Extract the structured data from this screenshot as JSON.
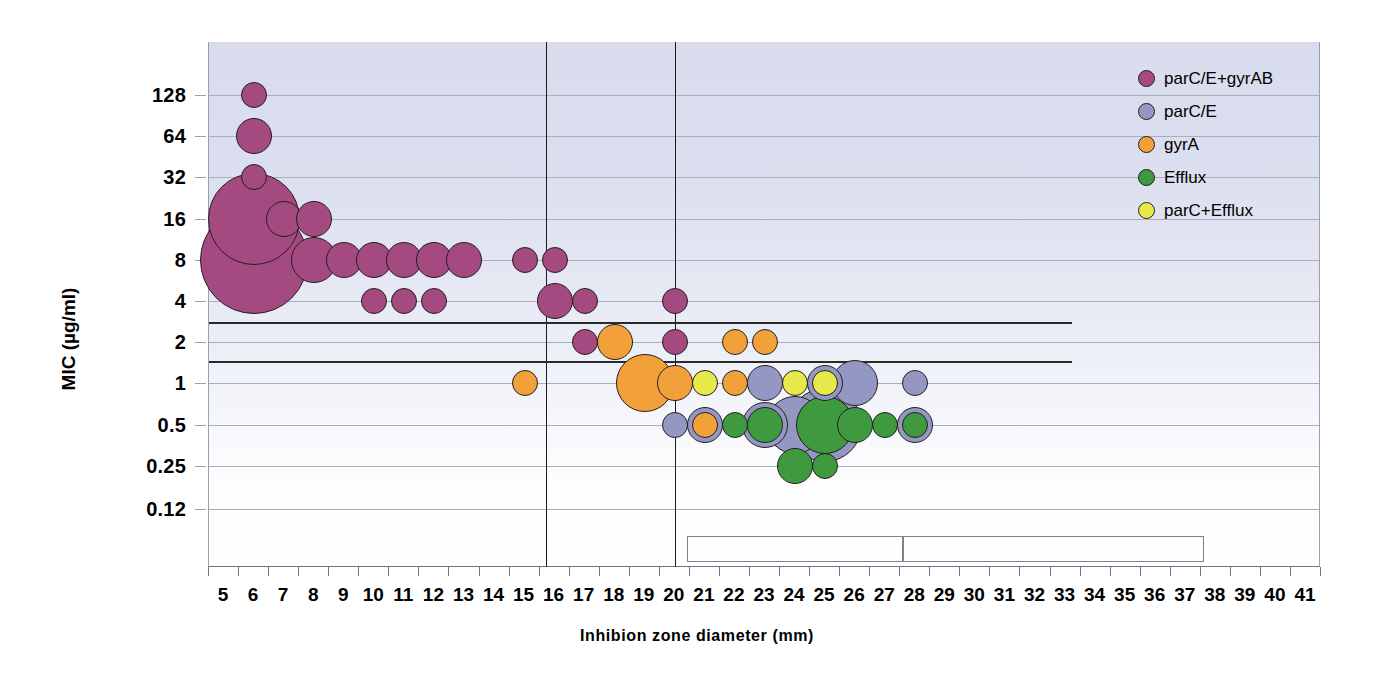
{
  "chart_data": {
    "type": "scatter",
    "title": "",
    "xlabel": "Inhibion zone diameter (mm)",
    "ylabel": "MIC (µg/ml)",
    "xlim": [
      4.5,
      41.5
    ],
    "ylim_labels": [
      "0.12",
      "0.25",
      "0.5",
      "1",
      "2",
      "4",
      "8",
      "16",
      "32",
      "64",
      "128"
    ],
    "x_ticks": [
      5,
      6,
      7,
      8,
      9,
      10,
      11,
      12,
      13,
      14,
      15,
      16,
      17,
      18,
      19,
      20,
      21,
      22,
      23,
      24,
      25,
      26,
      27,
      28,
      29,
      30,
      31,
      32,
      33,
      34,
      35,
      36,
      37,
      38,
      39,
      40,
      41
    ],
    "y_ticks": [
      0.12,
      0.25,
      0.5,
      1,
      2,
      4,
      8,
      16,
      32,
      64,
      128
    ],
    "grid": true,
    "legend_position": "right",
    "y_scale": "log2",
    "reference_lines": {
      "vertical": [
        15.7,
        20.0
      ],
      "horizontal": [
        2.8,
        1.45
      ]
    },
    "series": [
      {
        "name": "parC/E+gyrAB",
        "color": "#a44a80"
      },
      {
        "name": "parC/E",
        "color": "#9397c2"
      },
      {
        "name": "gyrA",
        "color": "#f2a13a"
      },
      {
        "name": "Efflux",
        "color": "#3f9a3f"
      },
      {
        "name": "parC+Efflux",
        "color": "#e7e84a"
      }
    ],
    "points": [
      {
        "x": 6,
        "y": 128,
        "size": 1,
        "series": 0
      },
      {
        "x": 6,
        "y": 64,
        "size": 2,
        "series": 0
      },
      {
        "x": 6,
        "y": 32,
        "size": 1,
        "series": 0
      },
      {
        "x": 6,
        "y": 16,
        "size": 6,
        "series": 0
      },
      {
        "x": 6,
        "y": 8,
        "size": 7,
        "series": 0
      },
      {
        "x": 7,
        "y": 16,
        "size": 2,
        "series": 0
      },
      {
        "x": 8,
        "y": 16,
        "size": 2,
        "series": 0
      },
      {
        "x": 8,
        "y": 8,
        "size": 3,
        "series": 0
      },
      {
        "x": 9,
        "y": 8,
        "size": 2,
        "series": 0
      },
      {
        "x": 10,
        "y": 8,
        "size": 2,
        "series": 0
      },
      {
        "x": 11,
        "y": 8,
        "size": 2,
        "series": 0
      },
      {
        "x": 12,
        "y": 8,
        "size": 2,
        "series": 0
      },
      {
        "x": 13,
        "y": 8,
        "size": 2,
        "series": 0
      },
      {
        "x": 10,
        "y": 4,
        "size": 1,
        "series": 0
      },
      {
        "x": 11,
        "y": 4,
        "size": 1,
        "series": 0
      },
      {
        "x": 12,
        "y": 4,
        "size": 1,
        "series": 0
      },
      {
        "x": 15,
        "y": 8,
        "size": 1,
        "series": 0
      },
      {
        "x": 16,
        "y": 8,
        "size": 1,
        "series": 0
      },
      {
        "x": 16,
        "y": 4,
        "size": 2,
        "series": 0
      },
      {
        "x": 17,
        "y": 4,
        "size": 1,
        "series": 0
      },
      {
        "x": 17,
        "y": 2,
        "size": 1,
        "series": 0
      },
      {
        "x": 18,
        "y": 2,
        "size": 2,
        "series": 2
      },
      {
        "x": 15,
        "y": 1,
        "size": 1,
        "series": 2
      },
      {
        "x": 20,
        "y": 4,
        "size": 1,
        "series": 0
      },
      {
        "x": 20,
        "y": 2,
        "size": 1,
        "series": 0
      },
      {
        "x": 22,
        "y": 2,
        "size": 1,
        "series": 2
      },
      {
        "x": 23,
        "y": 2,
        "size": 1,
        "series": 2
      },
      {
        "x": 19,
        "y": 1,
        "size": 4,
        "series": 2
      },
      {
        "x": 20,
        "y": 1,
        "size": 2,
        "series": 2
      },
      {
        "x": 21,
        "y": 1,
        "size": 1,
        "series": 4
      },
      {
        "x": 22,
        "y": 1,
        "size": 1,
        "series": 2
      },
      {
        "x": 23,
        "y": 1,
        "size": 2,
        "series": 1
      },
      {
        "x": 24,
        "y": 1,
        "size": 1,
        "series": 4
      },
      {
        "x": 25,
        "y": 1,
        "size": 2,
        "series": 1
      },
      {
        "x": 25,
        "y": 1,
        "size": 1,
        "series": 4
      },
      {
        "x": 26,
        "y": 1,
        "size": 3,
        "series": 1
      },
      {
        "x": 28,
        "y": 1,
        "size": 1,
        "series": 1
      },
      {
        "x": 20,
        "y": 0.5,
        "size": 1,
        "series": 1
      },
      {
        "x": 21,
        "y": 0.5,
        "size": 2,
        "series": 1
      },
      {
        "x": 21,
        "y": 0.5,
        "size": 1,
        "series": 2
      },
      {
        "x": 22,
        "y": 0.5,
        "size": 1,
        "series": 3
      },
      {
        "x": 23,
        "y": 0.5,
        "size": 3,
        "series": 1
      },
      {
        "x": 23,
        "y": 0.5,
        "size": 2,
        "series": 3
      },
      {
        "x": 24,
        "y": 0.5,
        "size": 4,
        "series": 1
      },
      {
        "x": 25,
        "y": 0.5,
        "size": 5,
        "series": 1
      },
      {
        "x": 25,
        "y": 0.5,
        "size": 4,
        "series": 3
      },
      {
        "x": 26,
        "y": 0.5,
        "size": 2,
        "series": 3
      },
      {
        "x": 27,
        "y": 0.5,
        "size": 1,
        "series": 3
      },
      {
        "x": 28,
        "y": 0.5,
        "size": 2,
        "series": 1
      },
      {
        "x": 28,
        "y": 0.5,
        "size": 1,
        "series": 3
      },
      {
        "x": 24,
        "y": 0.25,
        "size": 2,
        "series": 3
      },
      {
        "x": 25,
        "y": 0.25,
        "size": 1,
        "series": 3
      }
    ]
  },
  "legend": {
    "items": [
      {
        "label": "parC/E+gyrAB",
        "color": "#a44a80"
      },
      {
        "label": "parC/E",
        "color": "#9397c2"
      },
      {
        "label": "gyrA",
        "color": "#f2a13a"
      },
      {
        "label": "Efflux",
        "color": "#3f9a3f"
      },
      {
        "label": "parC+Efflux",
        "color": "#e7e84a"
      }
    ]
  },
  "bottom_boxes": [
    {
      "label": ""
    },
    {
      "label": ""
    }
  ]
}
